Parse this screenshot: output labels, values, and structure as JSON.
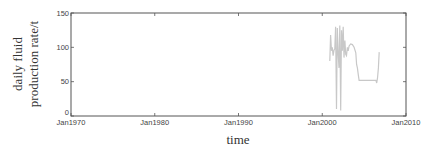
{
  "chart_data": {
    "type": "line",
    "title": "",
    "xlabel": "time",
    "ylabel": [
      "daily fluid",
      "production rate/t"
    ],
    "xlim": [
      "Jan1970",
      "Jan2010"
    ],
    "ylim": [
      0,
      150
    ],
    "x_ticks": [
      "Jan1970",
      "Jan1980",
      "Jan1990",
      "Jan2000",
      "Jan2010"
    ],
    "y_ticks": [
      "0",
      "50",
      "100",
      "150"
    ],
    "grid": false,
    "legend": null,
    "series": [
      {
        "name": "daily fluid production rate",
        "color": "#c8c8c8",
        "x": [
          2000.9,
          2001.0,
          2001.1,
          2001.2,
          2001.3,
          2001.4,
          2001.5,
          2001.6,
          2001.7,
          2001.8,
          2001.9,
          2002.0,
          2002.1,
          2002.2,
          2002.3,
          2002.4,
          2002.5,
          2002.6,
          2002.7,
          2002.8,
          2002.9,
          2003.0,
          2003.1,
          2003.2,
          2003.4,
          2003.6,
          2003.8,
          2004.0,
          2004.1,
          2004.2,
          2004.3,
          2004.4,
          2004.6,
          2005.0,
          2005.5,
          2006.0,
          2006.4,
          2006.5,
          2006.6,
          2006.7,
          2006.8
        ],
        "y": [
          80,
          118,
          95,
          100,
          88,
          96,
          98,
          130,
          10,
          128,
          90,
          70,
          132,
          8,
          125,
          95,
          130,
          85,
          110,
          90,
          88,
          100,
          95,
          102,
          105,
          104,
          100,
          92,
          75,
          70,
          60,
          52,
          52,
          52,
          52,
          52,
          52,
          48,
          55,
          70,
          93
        ]
      }
    ]
  }
}
